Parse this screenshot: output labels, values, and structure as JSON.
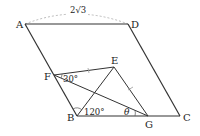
{
  "figure": {
    "type": "parallelogram geometry diagram",
    "points": {
      "A": "A",
      "B": "B",
      "C": "C",
      "D": "D",
      "E": "E",
      "F": "F",
      "G": "G"
    },
    "segments": [
      "AD",
      "DC",
      "CB",
      "BA",
      "FE",
      "EG",
      "FG",
      "BE"
    ],
    "annotations": {
      "AD_length": "2√3",
      "angle_F": "30°",
      "angle_B": "120°",
      "angle_G": "θ"
    },
    "equal_marks": [
      "FE",
      "EG"
    ],
    "colors": {
      "stroke": "#333333",
      "dashed": "#aaaaaa",
      "text": "#222222"
    }
  }
}
